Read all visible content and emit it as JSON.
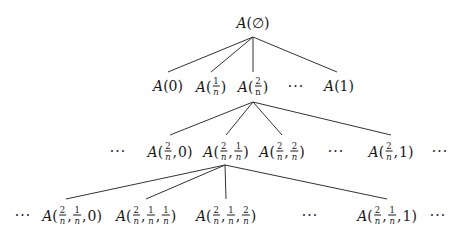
{
  "diagram": {
    "type": "tree",
    "root": {
      "label": "A(∅)",
      "func": "A",
      "args": [
        "∅"
      ],
      "pos": [
        253,
        23
      ]
    },
    "levels": [
      {
        "parent_anchor": [
          253,
          37
        ],
        "nodes": [
          {
            "id": "A0",
            "label": "A(0)",
            "func": "A",
            "args": [
              {
                "t": "0"
              }
            ],
            "pos": [
              168,
              86
            ],
            "edge_to": [
              168,
              72
            ]
          },
          {
            "id": "A1n",
            "label": "A(1/n)",
            "func": "A",
            "args": [
              {
                "num": "1",
                "den": "n"
              }
            ],
            "pos": [
              211,
              86
            ],
            "edge_to": [
              211,
              72
            ]
          },
          {
            "id": "A2n",
            "label": "A(2/n)",
            "func": "A",
            "args": [
              {
                "num": "2",
                "den": "n",
                "upright": true
              }
            ],
            "pos": [
              253,
              86
            ],
            "edge_to": [
              253,
              72
            ]
          },
          {
            "id": "A1",
            "label": "A(1)",
            "func": "A",
            "args": [
              {
                "t": "1"
              }
            ],
            "pos": [
              339,
              86
            ],
            "edge_to": [
              337,
              72
            ]
          }
        ],
        "ellipses": [
          {
            "text": "···",
            "pos": [
              296,
              86
            ]
          }
        ]
      },
      {
        "parent_anchor": [
          253,
          102
        ],
        "nodes": [
          {
            "id": "A2n0",
            "label": "A(2/n, 0)",
            "func": "A",
            "args": [
              {
                "num": "2",
                "den": "n"
              },
              {
                "t": "0"
              }
            ],
            "pos": [
              170,
              151
            ],
            "edge_to": [
              170,
              135
            ]
          },
          {
            "id": "A2n1n",
            "label": "A(2/n, 1/n)",
            "func": "A",
            "args": [
              {
                "num": "2",
                "den": "n"
              },
              {
                "num": "1",
                "den": "n"
              }
            ],
            "pos": [
              226,
              151
            ],
            "edge_to": [
              226,
              135
            ]
          },
          {
            "id": "A2n2n",
            "label": "A(2/n, 2/n)",
            "func": "A",
            "args": [
              {
                "num": "2",
                "den": "n"
              },
              {
                "num": "2",
                "den": "n"
              }
            ],
            "pos": [
              282,
              151
            ],
            "edge_to": [
              282,
              135
            ]
          },
          {
            "id": "A2n1",
            "label": "A(2/n, 1)",
            "func": "A",
            "args": [
              {
                "num": "2",
                "den": "n"
              },
              {
                "t": "1"
              }
            ],
            "pos": [
              391,
              151
            ],
            "edge_to": [
              391,
              135
            ]
          }
        ],
        "ellipses": [
          {
            "text": "···",
            "pos": [
              118,
              151
            ]
          },
          {
            "text": "···",
            "pos": [
              336,
              151
            ]
          },
          {
            "text": "···",
            "pos": [
              440,
              151
            ]
          }
        ]
      },
      {
        "parent_anchor": [
          225,
          165
        ],
        "nodes": [
          {
            "id": "A2n1n0",
            "label": "A(2/n, 1/n, 0)",
            "func": "A",
            "args": [
              {
                "num": "2",
                "den": "n"
              },
              {
                "num": "1",
                "den": "n"
              },
              {
                "t": "0"
              }
            ],
            "pos": [
              72,
              215
            ],
            "edge_to": [
              66,
              199
            ]
          },
          {
            "id": "A2n1n1n",
            "label": "A(2/n, 1/n, 1/n)",
            "func": "A",
            "args": [
              {
                "num": "2",
                "den": "n"
              },
              {
                "num": "1",
                "den": "n"
              },
              {
                "num": "1",
                "den": "n"
              }
            ],
            "pos": [
              146,
              215
            ],
            "edge_to": [
              146,
              199
            ]
          },
          {
            "id": "A2n1n2n",
            "label": "A(2/n, 1/n, 2/n)",
            "func": "A",
            "args": [
              {
                "num": "2",
                "den": "n"
              },
              {
                "num": "1",
                "den": "n"
              },
              {
                "num": "2",
                "den": "n"
              }
            ],
            "pos": [
              226,
              215
            ],
            "edge_to": [
              226,
              199
            ]
          },
          {
            "id": "A2n1n1",
            "label": "A(2/n, 1/n, 1)",
            "func": "A",
            "args": [
              {
                "num": "2",
                "den": "n"
              },
              {
                "num": "1",
                "den": "n"
              },
              {
                "t": "1"
              }
            ],
            "pos": [
              387,
              215
            ],
            "edge_to": [
              387,
              199
            ]
          }
        ],
        "ellipses": [
          {
            "text": "···",
            "pos": [
              23,
              215
            ]
          },
          {
            "text": "···",
            "pos": [
              310,
              215
            ]
          },
          {
            "text": "···",
            "pos": [
              438,
              215
            ]
          }
        ]
      }
    ]
  },
  "colors": {
    "background": "#ffffff",
    "text": "#1a1a1a",
    "edges": "#333333"
  }
}
